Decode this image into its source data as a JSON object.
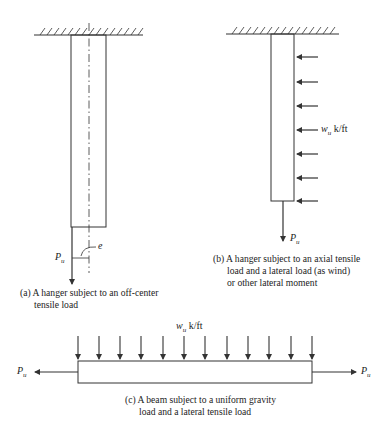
{
  "figures": {
    "a": {
      "load_label": "P",
      "load_sub": "u",
      "ecc_label": "e",
      "caption": {
        "line1": "(a) A hanger subject to an off-center",
        "line2": "tensile load"
      }
    },
    "b": {
      "load_label": "P",
      "load_sub": "u",
      "dist_label": "w",
      "dist_sub": "u",
      "dist_unit": " k/ft",
      "caption": {
        "line1": "(b) A hanger subject to an axial tensile",
        "line2": "load and a lateral load (as wind)",
        "line3": "or other lateral moment"
      }
    },
    "c": {
      "left_load_label": "P",
      "left_load_sub": "u",
      "right_load_label": "P",
      "right_load_sub": "u",
      "dist_label": "w",
      "dist_sub": "u",
      "dist_unit": " k/ft",
      "caption": {
        "line1": "(c) A beam subject to a uniform gravity",
        "line2": "load and a lateral tensile load"
      }
    }
  },
  "colors": {
    "line": "#333333",
    "background": "#ffffff"
  }
}
